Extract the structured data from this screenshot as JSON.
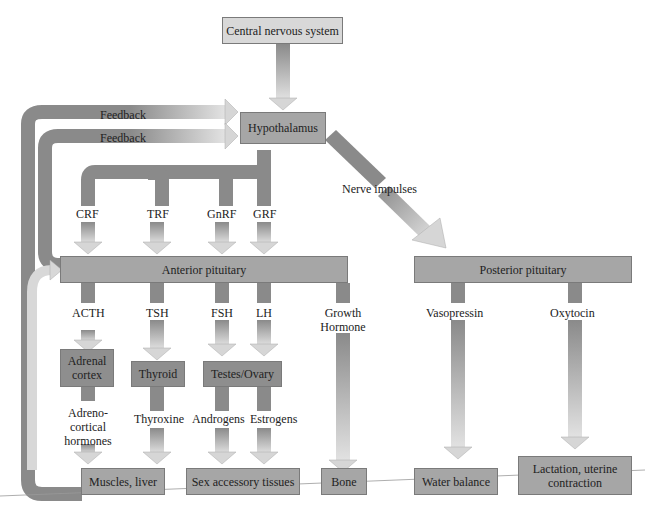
{
  "diagram": {
    "colors": {
      "box_light": "#d8d8d8",
      "box_mid": "#a6a6a6",
      "pathway_dark": "#8a8a8a",
      "arrow_light": "#d4d4d4"
    },
    "nodes": {
      "cns": "Central nervous system",
      "hypothalamus": "Hypothalamus",
      "anterior_pituitary": "Anterior pituitary",
      "posterior_pituitary": "Posterior pituitary",
      "adrenal_cortex": "Adrenal cortex",
      "thyroid": "Thyroid",
      "testes_ovary": "Testes/Ovary",
      "muscles_liver": "Muscles, liver",
      "sex_accessory": "Sex accessory tissues",
      "bone": "Bone",
      "water_balance": "Water balance",
      "lactation": "Lactation, uterine contraction"
    },
    "labels": {
      "feedback_1": "Feedback",
      "feedback_2": "Feedback",
      "nerve_impulses": "Nerve impulses",
      "crf": "CRF",
      "trf": "TRF",
      "gnrf": "GnRF",
      "grf": "GRF",
      "acth": "ACTH",
      "tsh": "TSH",
      "fsh": "FSH",
      "lh": "LH",
      "growth_hormone": "Growth Hormone",
      "vasopressin": "Vasopressin",
      "oxytocin": "Oxytocin",
      "adrenocortical": "Adreno- cortical hormones",
      "thyroxine": "Thyroxine",
      "androgens": "Androgens",
      "estrogens": "Estrogens"
    }
  }
}
